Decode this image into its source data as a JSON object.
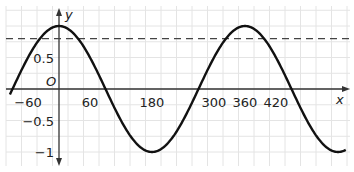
{
  "chart_data": {
    "type": "line",
    "title": "",
    "xlabel": "x",
    "ylabel": "y",
    "origin_label": "O",
    "function": "y = cos(x)",
    "xlim": [
      -95,
      555
    ],
    "ylim": [
      -1.1,
      1.2
    ],
    "grid": true,
    "x_ticks": [
      {
        "value": -60,
        "label": "−60"
      },
      {
        "value": 60,
        "label": "60"
      },
      {
        "value": 180,
        "label": "180"
      },
      {
        "value": 300,
        "label": "300"
      },
      {
        "value": 360,
        "label": "360"
      },
      {
        "value": 420,
        "label": "420"
      }
    ],
    "y_ticks": [
      {
        "value": 0.5,
        "label": "0.5"
      },
      {
        "value": -0.5,
        "label": "−0.5"
      },
      {
        "value": -1,
        "label": "−1"
      }
    ],
    "series": [
      {
        "name": "cos(x)",
        "x": [
          -90,
          0,
          90,
          180,
          270,
          360,
          450,
          540
        ],
        "values": [
          0,
          1,
          0,
          -1,
          0,
          1,
          0,
          -1
        ],
        "style": "solid",
        "color": "#111111"
      },
      {
        "name": "reference line",
        "y": 0.8,
        "style": "dashed",
        "color": "#444444"
      }
    ]
  }
}
